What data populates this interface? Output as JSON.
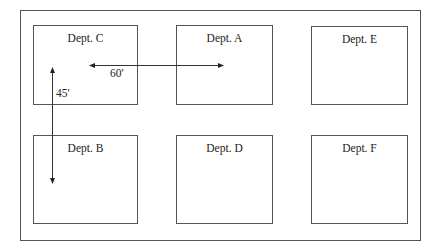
{
  "diagram": {
    "title": "",
    "departments": [
      {
        "id": "C",
        "label": "Dept. C",
        "row": 0,
        "col": 0,
        "x": 33,
        "y": 25,
        "w": 105,
        "h": 80
      },
      {
        "id": "A",
        "label": "Dept. A",
        "row": 0,
        "col": 1,
        "x": 176,
        "y": 25,
        "w": 97,
        "h": 80
      },
      {
        "id": "E",
        "label": "Dept. E",
        "row": 0,
        "col": 2,
        "x": 311,
        "y": 26,
        "w": 97,
        "h": 79
      },
      {
        "id": "B",
        "label": "Dept. B",
        "row": 1,
        "col": 0,
        "x": 33,
        "y": 135,
        "w": 105,
        "h": 89
      },
      {
        "id": "D",
        "label": "Dept. D",
        "row": 1,
        "col": 1,
        "x": 176,
        "y": 135,
        "w": 97,
        "h": 89
      },
      {
        "id": "F",
        "label": "Dept. F",
        "row": 1,
        "col": 2,
        "x": 311,
        "y": 135,
        "w": 97,
        "h": 89
      }
    ],
    "dimensions": [
      {
        "id": "horizontal",
        "from": "Dept. C",
        "to": "Dept. A",
        "label": "60'",
        "orientation": "horizontal-double-arrow"
      },
      {
        "id": "vertical",
        "from": "Dept. C",
        "to": "Dept. B",
        "label": "45'",
        "orientation": "vertical-double-arrow"
      }
    ],
    "colors": {
      "line": "#555555",
      "text": "#222222",
      "background": "#ffffff"
    }
  }
}
